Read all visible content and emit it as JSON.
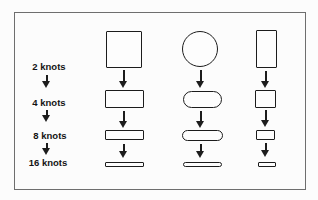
{
  "canvas": {
    "bg": "#fcfcfc",
    "ink": "#1c1c1c",
    "frame_color": "#6e6e6e"
  },
  "frame": {
    "x": 14,
    "y": 12,
    "w": 290,
    "h": 176
  },
  "speed_scale": {
    "labels": [
      {
        "text": "2 knots",
        "cx": 49,
        "cy": 67
      },
      {
        "text": "4 knots",
        "cx": 49,
        "cy": 103
      },
      {
        "text": "8 knots",
        "cx": 50,
        "cy": 136
      },
      {
        "text": "16 knots",
        "cx": 48,
        "cy": 163
      }
    ],
    "arrows": [
      {
        "cx": 47,
        "y": 75,
        "h": 13
      },
      {
        "cx": 47,
        "y": 110,
        "h": 12
      },
      {
        "cx": 47,
        "y": 143,
        "h": 12
      }
    ]
  },
  "columns": [
    {
      "name": "square-column",
      "shapes": [
        {
          "kind": "square",
          "x": 106,
          "y": 31,
          "w": 36,
          "h": 37
        },
        {
          "kind": "rect",
          "x": 105,
          "y": 90,
          "w": 39,
          "h": 18
        },
        {
          "kind": "rect",
          "x": 105,
          "y": 130,
          "w": 39,
          "h": 10
        },
        {
          "kind": "rect",
          "x": 105,
          "y": 162,
          "w": 38.5,
          "h": 5
        }
      ],
      "arrows": [
        {
          "cx": 124,
          "y": 70,
          "h": 18
        },
        {
          "cx": 124,
          "y": 111,
          "h": 17
        },
        {
          "cx": 124,
          "y": 144,
          "h": 14
        }
      ]
    },
    {
      "name": "circle-column",
      "shapes": [
        {
          "kind": "circle",
          "x": 182,
          "y": 31,
          "w": 36,
          "h": 36
        },
        {
          "kind": "pill",
          "x": 183,
          "y": 91,
          "w": 39,
          "h": 17
        },
        {
          "kind": "pill",
          "x": 182,
          "y": 130,
          "w": 41,
          "h": 10.5
        },
        {
          "kind": "pill",
          "x": 183,
          "y": 162,
          "w": 39,
          "h": 5
        }
      ],
      "arrows": [
        {
          "cx": 201,
          "y": 70,
          "h": 18
        },
        {
          "cx": 201,
          "y": 111,
          "h": 17
        },
        {
          "cx": 201,
          "y": 144,
          "h": 14
        }
      ]
    },
    {
      "name": "tall-rect-column",
      "shapes": [
        {
          "kind": "rect",
          "x": 256,
          "y": 30,
          "w": 21,
          "h": 38
        },
        {
          "kind": "square",
          "x": 255,
          "y": 90,
          "w": 21,
          "h": 18
        },
        {
          "kind": "rect",
          "x": 256,
          "y": 130,
          "w": 19,
          "h": 10
        },
        {
          "kind": "rect",
          "x": 258,
          "y": 162,
          "w": 18,
          "h": 5
        }
      ],
      "arrows": [
        {
          "cx": 266,
          "y": 71,
          "h": 17
        },
        {
          "cx": 266,
          "y": 110,
          "h": 17
        },
        {
          "cx": 266,
          "y": 143,
          "h": 14
        }
      ]
    }
  ]
}
